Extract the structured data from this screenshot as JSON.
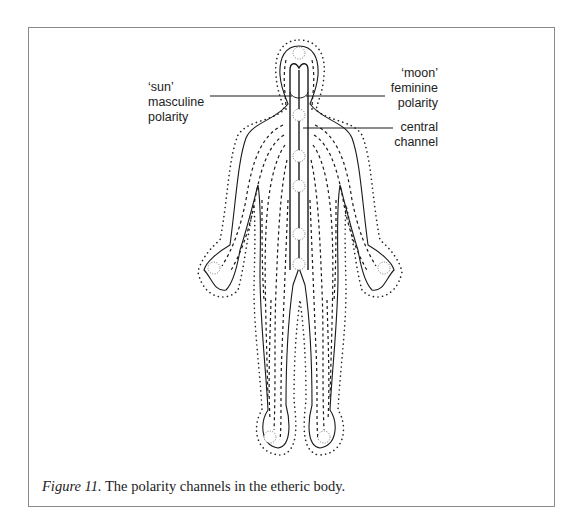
{
  "figure": {
    "caption_label": "Figure 11.",
    "caption_text": " The polarity channels in the etheric body.",
    "labels": {
      "sun": {
        "line1": "‘sun’",
        "line2": "masculine",
        "line3": "polarity"
      },
      "moon": {
        "line1": "‘moon’",
        "line2": "feminine",
        "line3": "polarity"
      },
      "central": {
        "line1": "central",
        "line2": "channel"
      }
    },
    "colors": {
      "line": "#1a1a1a",
      "frame": "#8a8a8a",
      "background": "#ffffff"
    },
    "chakra_points": [
      "crown",
      "throat",
      "heart",
      "solar-plexus",
      "sacral",
      "root",
      "left-palm",
      "right-palm",
      "left-foot",
      "right-foot"
    ]
  }
}
